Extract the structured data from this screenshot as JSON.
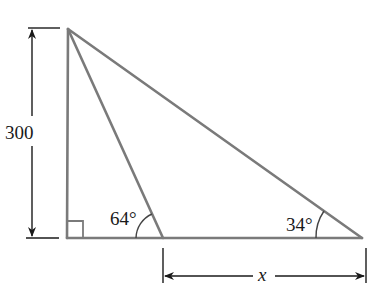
{
  "diagram": {
    "type": "right-triangle-trigonometry",
    "colors": {
      "triangle_stroke": "#7a7a7a",
      "dimension_stroke": "#1a1a1a",
      "text": "#1a1a1a",
      "background": "#ffffff"
    },
    "labels": {
      "height": "300",
      "angle_left": "64°",
      "angle_right": "34°",
      "base_unknown": "x"
    },
    "right_angle_marker": true
  }
}
